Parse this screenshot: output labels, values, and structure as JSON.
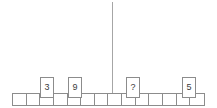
{
  "canvas": {
    "width": 217,
    "height": 108,
    "background": "#ffffff",
    "line_color": "#8c8c8c",
    "fulcrum_color": "#a6a6a6",
    "text_color": "#3b3b3b"
  },
  "fulcrum": {
    "name": "center-pointer-line",
    "x": 112,
    "top": 2,
    "bottom": 94,
    "thickness": 1
  },
  "strip": {
    "name": "number-strip",
    "x": 12,
    "y": 93,
    "width": 193,
    "height": 13,
    "cell_count": 14,
    "cell_width": 13.78,
    "cells": [
      {
        "index": 1,
        "label": ""
      },
      {
        "index": 2,
        "label": ""
      },
      {
        "index": 3,
        "label": ""
      },
      {
        "index": 4,
        "label": ""
      },
      {
        "index": 5,
        "label": ""
      },
      {
        "index": 6,
        "label": ""
      },
      {
        "index": 7,
        "label": ""
      },
      {
        "index": 8,
        "label": ""
      },
      {
        "index": 9,
        "label": ""
      },
      {
        "index": 10,
        "label": ""
      },
      {
        "index": 11,
        "label": ""
      },
      {
        "index": 12,
        "label": ""
      },
      {
        "index": 13,
        "label": ""
      },
      {
        "index": 14,
        "label": ""
      }
    ]
  },
  "tiles": [
    {
      "id": "tile-3",
      "label": "3",
      "cell_index": 3,
      "x": 40,
      "y": 77,
      "width": 14,
      "height": 21,
      "font_size": 9
    },
    {
      "id": "tile-9",
      "label": "9",
      "cell_index": 5,
      "x": 68,
      "y": 77,
      "width": 14,
      "height": 21,
      "font_size": 9
    },
    {
      "id": "tile-unknown",
      "label": "?",
      "cell_index": 9,
      "x": 126,
      "y": 77,
      "width": 14,
      "height": 21,
      "font_size": 9
    },
    {
      "id": "tile-5",
      "label": "5",
      "cell_index": 13,
      "x": 182,
      "y": 77,
      "width": 14,
      "height": 21,
      "font_size": 9
    }
  ]
}
